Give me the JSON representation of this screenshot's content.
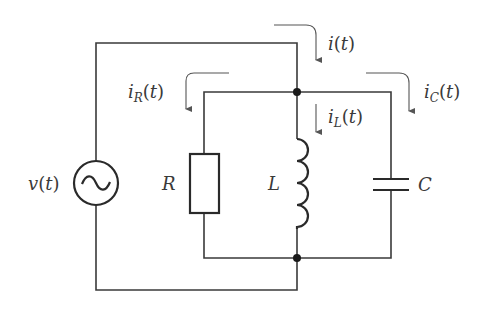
{
  "diagram": {
    "type": "parallel RLC circuit",
    "colors": {
      "wire": "#3a3a3a",
      "arrow": "#555555",
      "background": "#ffffff"
    },
    "source": {
      "label": "v(t)",
      "symbol": "ac-voltage-source"
    },
    "components": [
      {
        "id": "R",
        "label": "R",
        "symbol": "resistor"
      },
      {
        "id": "L",
        "label": "L",
        "symbol": "inductor"
      },
      {
        "id": "C",
        "label": "C",
        "symbol": "capacitor"
      }
    ],
    "currents": [
      {
        "id": "i",
        "base": "i",
        "sub": "",
        "arg": "(t)",
        "text": "i(t)"
      },
      {
        "id": "iR",
        "base": "i",
        "sub": "R",
        "arg": "(t)",
        "text": "i_R(t)"
      },
      {
        "id": "iL",
        "base": "i",
        "sub": "L",
        "arg": "(t)",
        "text": "i_L(t)"
      },
      {
        "id": "iC",
        "base": "i",
        "sub": "C",
        "arg": "(t)",
        "text": "i_C(t)"
      }
    ],
    "nodes": [
      {
        "id": "top-junction"
      },
      {
        "id": "bottom-junction"
      }
    ]
  }
}
